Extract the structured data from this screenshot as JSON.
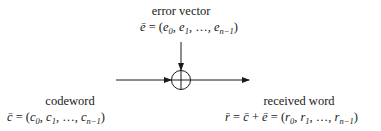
{
  "diagram": {
    "nodes": {
      "error": {
        "label": "error vector",
        "equation": "ē = (e₀, e₁, …, eₙ₋₁)"
      },
      "codeword": {
        "label": "codeword",
        "equation": "c̄ = (c₀, c₁, …, cₙ₋₁)"
      },
      "received": {
        "label": "received word",
        "equation": "r̄ = c̄ + ē = (r₀, r₁, …, rₙ₋₁)"
      },
      "adder": {
        "symbol": "⊕",
        "description": "modulo-2 adder"
      }
    },
    "edges": [
      {
        "from": "codeword",
        "to": "adder"
      },
      {
        "from": "error",
        "to": "adder"
      },
      {
        "from": "adder",
        "to": "received"
      }
    ]
  }
}
